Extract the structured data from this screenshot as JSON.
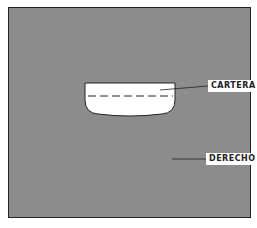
{
  "diagram": {
    "labels": {
      "cartera": "CARTERA",
      "derecho": "DERECHO"
    },
    "colors": {
      "background": "#c4c4c4",
      "line": "#222222",
      "box_fill": "#ffffff"
    }
  }
}
